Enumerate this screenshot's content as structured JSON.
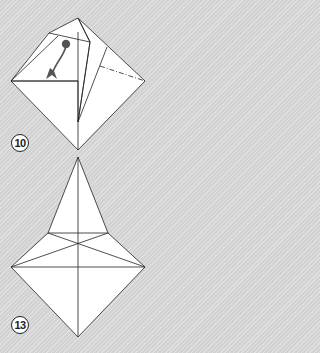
{
  "steps": [
    {
      "number": "10",
      "description": "Fold the flap down along the crease (arrow shows direction)"
    },
    {
      "number": "13",
      "description": "Resulting kite shape with crease lines"
    }
  ],
  "colors": {
    "background": "#d9d9d9",
    "paper": "#ffffff",
    "line": "#222222",
    "arrow": "#555555"
  }
}
